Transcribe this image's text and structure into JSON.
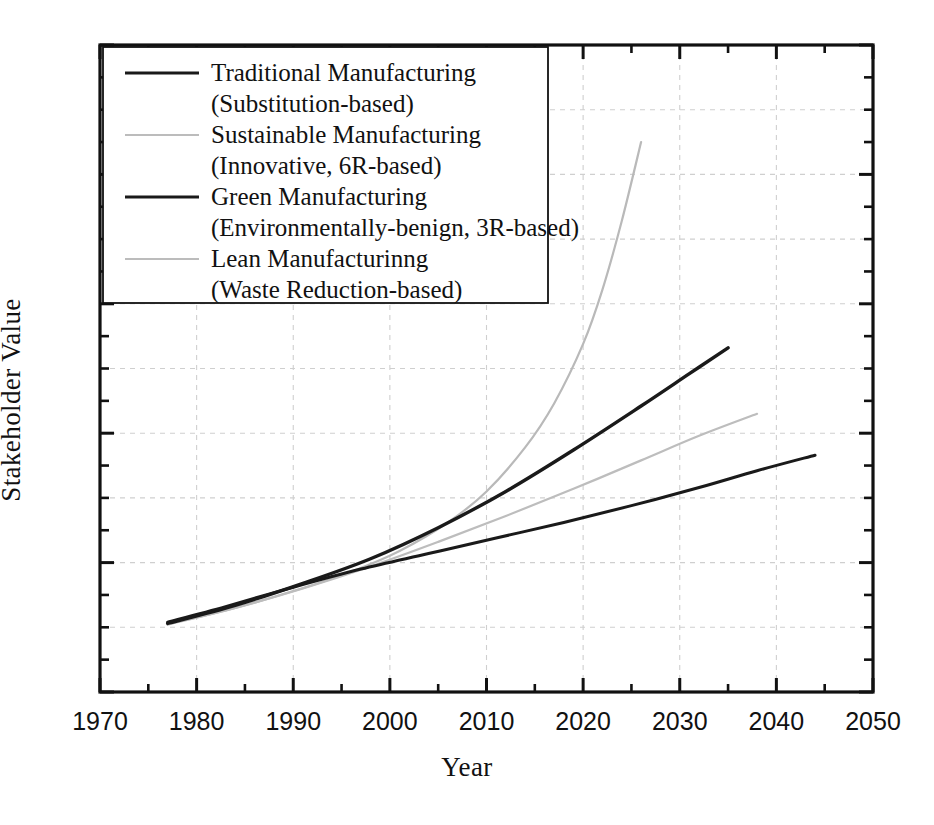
{
  "chart_data": {
    "type": "line",
    "title": "",
    "xlabel": "Year",
    "ylabel": "Stakeholder Value",
    "xlim": [
      1970,
      2050
    ],
    "ylim": [
      0,
      10
    ],
    "xticks": [
      1970,
      1980,
      1990,
      2000,
      2010,
      2020,
      2030,
      2040,
      2050
    ],
    "xtick_labels": [
      "1970",
      "1980",
      "1990",
      "2000",
      "2010",
      "2020",
      "2030",
      "2040",
      "2050"
    ],
    "xminor_ticks": [
      1975,
      1985,
      1995,
      2005,
      2015,
      2025,
      2035,
      2045
    ],
    "yticks": [
      0,
      1,
      2,
      3,
      4,
      5,
      6,
      7,
      8,
      9,
      10
    ],
    "ytick_labels": [],
    "grid": "dashed light gray at major ticks, both axes",
    "legend_position": "upper-left, inside plot, boxed",
    "series": [
      {
        "name": "Traditional Manufacturing",
        "sub": "(Substitution-based)",
        "legend_line": "solid-dark",
        "color": "#1a1a1a",
        "width": 3.0,
        "x": [
          1977,
          1983,
          1990,
          1997,
          2004,
          2011,
          2018,
          2025,
          2032,
          2038,
          2044
        ],
        "y": [
          1.08,
          1.32,
          1.62,
          1.9,
          2.14,
          2.38,
          2.62,
          2.88,
          3.16,
          3.42,
          3.66
        ]
      },
      {
        "name": "Sustainable Manufacturing",
        "sub": "(Innovative, 6R-based)",
        "legend_line": "solid-light",
        "color": "#b9b9b9",
        "width": 2.2,
        "x": [
          1977,
          1984,
          1990,
          1996,
          2001,
          2006,
          2010,
          2014,
          2017,
          2020,
          2022,
          2024,
          2026
        ],
        "y": [
          1.04,
          1.3,
          1.56,
          1.86,
          2.18,
          2.62,
          3.1,
          3.78,
          4.46,
          5.38,
          6.22,
          7.28,
          8.5
        ]
      },
      {
        "name": "Green Manufacturing",
        "sub": "(Environmentally-benign, 3R-based)",
        "legend_line": "solid-dark",
        "color": "#1a1a1a",
        "width": 3.4,
        "x": [
          1977,
          1984,
          1991,
          1998,
          2005,
          2012,
          2019,
          2026,
          2031,
          2035
        ],
        "y": [
          1.06,
          1.34,
          1.68,
          2.06,
          2.54,
          3.1,
          3.74,
          4.42,
          4.92,
          5.32
        ]
      },
      {
        "name": "Lean Manufacturinng",
        "sub": "(Waste Reduction-based)",
        "legend_line": "solid-light",
        "color": "#bdbdbd",
        "width": 2.2,
        "x": [
          1977,
          1984,
          1991,
          1998,
          2005,
          2012,
          2019,
          2026,
          2032,
          2038
        ],
        "y": [
          1.05,
          1.3,
          1.6,
          1.94,
          2.32,
          2.72,
          3.14,
          3.58,
          3.96,
          4.3
        ]
      }
    ]
  },
  "axis": {
    "x_title": "Year",
    "y_title": "Stakeholder Value"
  },
  "legend": {
    "items": [
      {
        "label": "Traditional Manufacturing",
        "sub": "(Substitution-based)",
        "style": "dark"
      },
      {
        "label": "Sustainable Manufacturing",
        "sub": "(Innovative, 6R-based)",
        "style": "light"
      },
      {
        "label": "Green Manufacturing",
        "sub": "(Environmentally-benign, 3R-based)",
        "style": "dark"
      },
      {
        "label": "Lean Manufacturinng",
        "sub": "(Waste Reduction-based)",
        "style": "light"
      }
    ]
  },
  "colors": {
    "frame": "#111111",
    "grid": "#cfcfcf",
    "dark_series": "#1a1a1a",
    "light_series": "#bcbcbc"
  }
}
